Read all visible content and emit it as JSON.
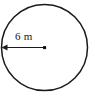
{
  "figure": {
    "kind": "circle-radius-diagram",
    "background_color": "#ffffff",
    "stroke_color": "#1a1a1a",
    "canvas": {
      "width": 95,
      "height": 99
    },
    "circle": {
      "center_x": 44.5,
      "center_y": 47.5,
      "radius_px": 43,
      "fill_color": "#ffffff",
      "stroke_color": "#1a1a1a",
      "stroke_width": 1.5
    },
    "radius_arrow": {
      "from_x": 44.5,
      "from_y": 47.5,
      "to_x": 2,
      "to_y": 47.5,
      "arrow_direction": "left",
      "stroke_color": "#1a1a1a",
      "stroke_width": 1.2
    },
    "center_marker": {
      "x": 44.5,
      "y": 47.5,
      "size_px": 3,
      "shape": "square",
      "color": "#0d0d0d"
    },
    "label": {
      "text": "6 m",
      "value": 6,
      "unit": "m",
      "quantity": "radius",
      "x": 15,
      "y": 40,
      "font_size_px": 11,
      "color": "#181818"
    }
  }
}
